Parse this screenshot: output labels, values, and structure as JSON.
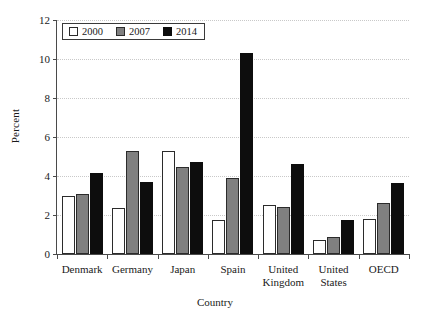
{
  "chart_data": {
    "type": "bar",
    "title": "",
    "xlabel": "Country",
    "ylabel": "Percent",
    "categories": [
      "Denmark",
      "Germany",
      "Japan",
      "Spain",
      "United Kingdom",
      "United States",
      "OECD"
    ],
    "category_lines": [
      [
        "Denmark"
      ],
      [
        "Germany"
      ],
      [
        "Japan"
      ],
      [
        "Spain"
      ],
      [
        "United",
        "Kingdom"
      ],
      [
        "United",
        "States"
      ],
      [
        "OECD"
      ]
    ],
    "series": [
      {
        "name": "2000",
        "color": "#ffffff",
        "values": [
          3.0,
          2.35,
          5.3,
          1.75,
          2.5,
          0.7,
          1.8
        ]
      },
      {
        "name": "2007",
        "color": "#808080",
        "values": [
          3.1,
          5.3,
          4.45,
          3.9,
          2.4,
          0.85,
          2.6
        ]
      },
      {
        "name": "2014",
        "color": "#0d0d0d",
        "values": [
          4.15,
          3.7,
          4.7,
          10.3,
          4.6,
          1.75,
          3.65
        ]
      }
    ],
    "ylim": [
      0,
      12
    ],
    "yticks": [
      0,
      2,
      4,
      6,
      8,
      10,
      12
    ],
    "ytick_labels": [
      "0",
      "2",
      "4",
      "6",
      "8",
      "10",
      "12"
    ],
    "grid": true,
    "grid_axis": "y",
    "legend_position": "top-left"
  }
}
